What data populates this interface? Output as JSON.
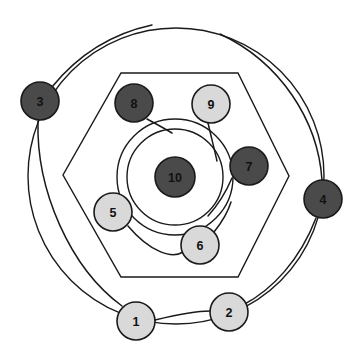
{
  "figure": {
    "width": 359,
    "height": 359,
    "background": "#ffffff",
    "stroke_color": "#1a1a1a"
  },
  "colors": {
    "dark_node_fill": "#4a4a4a",
    "light_node_fill": "#d9d9d9",
    "node_outline": "#1a1a1a",
    "label_color": "#111111",
    "shape_outline": "#1a1a1a"
  },
  "chart_data": {
    "type": "scatter",
    "xlabel": "",
    "ylabel": "",
    "xlim": [
      0,
      359
    ],
    "ylim": [
      0,
      359
    ],
    "grid": false,
    "legend": "none",
    "shells": [
      {
        "name": "outer-circle",
        "shape": "circle",
        "cx": 176,
        "cy": 176,
        "r": 148
      },
      {
        "name": "hexagon",
        "shape": "polygon",
        "points": "121,73 238,73 289,176 238,277 121,277 63,175"
      },
      {
        "name": "middle-circle",
        "shape": "circle",
        "cx": 175,
        "cy": 177,
        "r": 58
      },
      {
        "name": "inner-circle",
        "shape": "circle",
        "cx": 175,
        "cy": 177,
        "r": 48
      }
    ],
    "edges": [
      {
        "from": "3",
        "to": "outer-arc-up",
        "path": "M 52 87 C 78 55 110 34 152 25"
      },
      {
        "from": "3",
        "to": "1",
        "path": "M 38 121 C 36 190 70 268 122 306"
      },
      {
        "from": "4",
        "to": "outer-arc-up",
        "path": "M 322 180 C 318 120 280 62 220 34"
      },
      {
        "from": "4",
        "to": "2",
        "path": "M 316 218 C 300 260 272 290 243 305"
      },
      {
        "from": "1",
        "to": "2",
        "path": "M 155 320 C 180 314 198 311 210 311"
      },
      {
        "from": "5",
        "to": "6",
        "path": "M 128 226 C 150 252 172 259 183 252"
      },
      {
        "from": "8",
        "to": "middle-ring",
        "path": "M 147 119 C 160 126 167 130 172 133"
      },
      {
        "from": "9",
        "to": "middle-ring",
        "path": "M 208 123 C 212 140 215 152 217 161"
      },
      {
        "from": "7",
        "to": "middle-ring",
        "path": "M 232 178 C 226 192 218 205 208 216"
      },
      {
        "from": "6",
        "to": "middle-ring",
        "path": "M 214 232 C 222 222 228 212 231 202"
      }
    ],
    "nodes": [
      {
        "id": "1",
        "label": "1",
        "cx": 136,
        "cy": 321,
        "r": 19,
        "fill": "#d9d9d9",
        "tone": "light",
        "ring": "outer"
      },
      {
        "id": "2",
        "label": "2",
        "cx": 229,
        "cy": 312,
        "r": 19,
        "fill": "#d9d9d9",
        "tone": "light",
        "ring": "outer"
      },
      {
        "id": "3",
        "label": "3",
        "cx": 40,
        "cy": 101,
        "r": 19,
        "fill": "#4a4a4a",
        "tone": "dark",
        "ring": "outer"
      },
      {
        "id": "4",
        "label": "4",
        "cx": 323,
        "cy": 199,
        "r": 19,
        "fill": "#4a4a4a",
        "tone": "dark",
        "ring": "outer"
      },
      {
        "id": "5",
        "label": "5",
        "cx": 113,
        "cy": 212,
        "r": 19,
        "fill": "#d9d9d9",
        "tone": "light",
        "ring": "hexagon"
      },
      {
        "id": "6",
        "label": "6",
        "cx": 200,
        "cy": 245,
        "r": 19,
        "fill": "#d9d9d9",
        "tone": "light",
        "ring": "hexagon"
      },
      {
        "id": "7",
        "label": "7",
        "cx": 249,
        "cy": 166,
        "r": 19,
        "fill": "#4a4a4a",
        "tone": "dark",
        "ring": "hexagon"
      },
      {
        "id": "8",
        "label": "8",
        "cx": 134,
        "cy": 103,
        "r": 19,
        "fill": "#4a4a4a",
        "tone": "dark",
        "ring": "hexagon"
      },
      {
        "id": "9",
        "label": "9",
        "cx": 211,
        "cy": 104,
        "r": 19,
        "fill": "#d9d9d9",
        "tone": "light",
        "ring": "hexagon"
      },
      {
        "id": "10",
        "label": "10",
        "cx": 175,
        "cy": 177,
        "r": 20,
        "fill": "#4a4a4a",
        "tone": "dark",
        "ring": "center"
      }
    ]
  }
}
